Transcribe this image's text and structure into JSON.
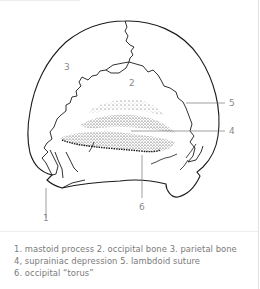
{
  "figure": {
    "labels": [
      "1",
      "2",
      "3",
      "4",
      "5",
      "6"
    ]
  },
  "caption": {
    "lines": [
      "1. mastoid process 2. occipital bone 3. parietal bone",
      "4, suprainiac depression 5. lambdoid suture",
      "6. occipital “torus”"
    ]
  },
  "legend": [
    {
      "number": "1",
      "term": "mastoid process"
    },
    {
      "number": "2",
      "term": "occipital bone"
    },
    {
      "number": "3",
      "term": "parietal bone"
    },
    {
      "number": "4",
      "term": "suprainiac depression"
    },
    {
      "number": "5",
      "term": "lambdoid suture"
    },
    {
      "number": "6",
      "term": "occipital “torus”"
    }
  ]
}
